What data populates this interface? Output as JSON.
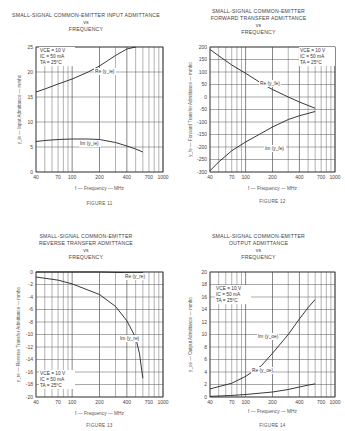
{
  "page": {
    "figures": [
      {
        "id": "fig11",
        "title": "SMALL-SIGNAL COMMON-EMITTER INPUT ADMITTANCE\nvs\nFREQUENCY",
        "xlabel": "f — Frequency — MHz",
        "ylabel": "y_ie — Input Admittance — mmho",
        "caption": "FIGURE 11",
        "conditions": [
          "VCE = 10 V",
          "IC = 50 mA",
          "TA = 25°C"
        ],
        "curve_labels": [
          "Re (y_ie)",
          "Im (y_ie)"
        ]
      },
      {
        "id": "fig12",
        "title": "SMALL-SIGNAL COMMON-EMITTER\nFORWARD TRANSFER ADMITTANCE\nvs\nFREQUENCY",
        "xlabel": "f — Frequency — MHz",
        "ylabel": "y_fe — Forward Transfer Admittance — mmho",
        "caption": "FIGURE 12",
        "conditions": [
          "VCE = 10 V",
          "IC = 50 mA",
          "TA = 25°C"
        ],
        "curve_labels": [
          "Re (y_fe)",
          "Im (y_fe)"
        ]
      },
      {
        "id": "fig13",
        "title": "SMALL-SIGNAL COMMON-EMITTER\nREVERSE TRANSFER ADMITTANCE\nvs\nFREQUENCY",
        "xlabel": "f — Frequency — MHz",
        "ylabel": "y_re — Reverse Transfer Admittance — mmho",
        "caption": "FIGURE 13",
        "conditions": [
          "VCE = 10 V",
          "IC = 50 mA",
          "TA = 25°C"
        ],
        "curve_labels": [
          "Re (y_re)",
          "Im (y_re)"
        ]
      },
      {
        "id": "fig14",
        "title": "SMALL-SIGNAL COMMON-EMITTER\nOUTPUT ADMITTANCE\nvs\nFREQUENCY",
        "xlabel": "f — Frequency — MHz",
        "ylabel": "y_oe — Output Admittance — mmho",
        "caption": "FIGURE 14",
        "conditions": [
          "VCE = 10 V",
          "IC = 50 mA",
          "TA = 25°C"
        ],
        "curve_labels": [
          "Im (y_oe)",
          "Re (y_oe)"
        ]
      }
    ]
  },
  "chart_data": [
    {
      "type": "line",
      "title": "SMALL-SIGNAL COMMON-EMITTER INPUT ADMITTANCE vs FREQUENCY",
      "xlabel": "f — Frequency — MHz",
      "ylabel": "y_ie — Input Admittance — mmho",
      "xscale": "log",
      "xlim": [
        40,
        1000
      ],
      "ylim": [
        0,
        25
      ],
      "xticks": [
        40,
        70,
        100,
        200,
        400,
        700,
        1000
      ],
      "xtick_labels": [
        "40",
        "70",
        "100",
        "200",
        "400",
        "700",
        "1000"
      ],
      "yticks": [
        0,
        5,
        10,
        15,
        20,
        25
      ],
      "grid": true,
      "x": [
        40,
        50,
        70,
        100,
        150,
        200,
        300,
        400,
        500,
        600
      ],
      "series": [
        {
          "name": "Re (y_ie)",
          "x": [
            40,
            50,
            70,
            100,
            150,
            200,
            300,
            400,
            500
          ],
          "values": [
            16.0,
            16.6,
            17.6,
            18.6,
            20.0,
            21.2,
            23.3,
            24.6,
            25.0
          ]
        },
        {
          "name": "Im (y_ie)",
          "x": [
            40,
            50,
            70,
            100,
            150,
            200,
            300,
            400,
            500,
            600
          ],
          "values": [
            6.1,
            6.3,
            6.5,
            6.6,
            6.6,
            6.5,
            5.9,
            5.2,
            4.6,
            4.0
          ]
        }
      ],
      "annotations": [
        "VCE = 10 V",
        "IC = 50 mA",
        "TA = 25°C"
      ],
      "caption": "FIGURE 11"
    },
    {
      "type": "line",
      "title": "SMALL-SIGNAL COMMON-EMITTER FORWARD TRANSFER ADMITTANCE vs FREQUENCY",
      "xlabel": "f — Frequency — MHz",
      "ylabel": "y_fe — Forward Transfer Admittance — mmho",
      "xscale": "log",
      "xlim": [
        40,
        1000
      ],
      "ylim": [
        -300,
        200
      ],
      "xticks": [
        40,
        70,
        100,
        200,
        400,
        700,
        1000
      ],
      "xtick_labels": [
        "40",
        "70",
        "100",
        "200",
        "400",
        "700",
        "1000"
      ],
      "yticks": [
        -300,
        -250,
        -200,
        -150,
        -100,
        -50,
        0,
        50,
        100,
        150,
        200
      ],
      "grid": true,
      "series": [
        {
          "name": "Re (y_fe)",
          "x": [
            40,
            50,
            70,
            100,
            150,
            200,
            300,
            400,
            600
          ],
          "values": [
            190,
            165,
            128,
            95,
            55,
            30,
            0,
            -20,
            -45
          ]
        },
        {
          "name": "Im (y_fe)",
          "x": [
            40,
            50,
            70,
            100,
            150,
            200,
            300,
            400,
            600
          ],
          "values": [
            -295,
            -260,
            -215,
            -180,
            -145,
            -120,
            -90,
            -75,
            -58
          ]
        }
      ],
      "annotations": [
        "VCE = 10 V",
        "IC = 50 mA",
        "TA = 25°C"
      ],
      "caption": "FIGURE 12"
    },
    {
      "type": "line",
      "title": "SMALL-SIGNAL COMMON-EMITTER REVERSE TRANSFER ADMITTANCE vs FREQUENCY",
      "xlabel": "f — Frequency — MHz",
      "ylabel": "y_re — Reverse Transfer Admittance — mmho",
      "xscale": "log",
      "xlim": [
        40,
        1000
      ],
      "ylim": [
        -20,
        0
      ],
      "xticks": [
        40,
        70,
        100,
        200,
        400,
        700,
        1000
      ],
      "xtick_labels": [
        "40",
        "70",
        "100",
        "200",
        "400",
        "700",
        "1000"
      ],
      "yticks": [
        -20,
        -18,
        -16,
        -14,
        -12,
        -10,
        -8,
        -6,
        -4,
        -2,
        0
      ],
      "grid": true,
      "series": [
        {
          "name": "Re (y_re)",
          "x": [
            40,
            100,
            200,
            400,
            600
          ],
          "values": [
            0.0,
            0.0,
            0.0,
            -0.1,
            -0.1
          ]
        },
        {
          "name": "Im (y_re)",
          "x": [
            40,
            70,
            100,
            200,
            300,
            400,
            500,
            550,
            600
          ],
          "values": [
            -0.8,
            -1.3,
            -1.9,
            -3.6,
            -5.5,
            -7.8,
            -10.5,
            -13.0,
            -17.0
          ]
        }
      ],
      "annotations": [
        "VCE = 10 V",
        "IC = 50 mA",
        "TA = 25°C"
      ],
      "caption": "FIGURE 13"
    },
    {
      "type": "line",
      "title": "SMALL-SIGNAL COMMON-EMITTER OUTPUT ADMITTANCE vs FREQUENCY",
      "xlabel": "f — Frequency — MHz",
      "ylabel": "y_oe — Output Admittance — mmho",
      "xscale": "log",
      "xlim": [
        40,
        1000
      ],
      "ylim": [
        0,
        20
      ],
      "xticks": [
        40,
        70,
        100,
        200,
        400,
        700,
        1000
      ],
      "xtick_labels": [
        "40",
        "70",
        "100",
        "200",
        "400",
        "700",
        "1000"
      ],
      "yticks": [
        0,
        2,
        4,
        6,
        8,
        10,
        12,
        14,
        16,
        18,
        20
      ],
      "grid": true,
      "series": [
        {
          "name": "Im (y_oe)",
          "x": [
            40,
            70,
            100,
            150,
            200,
            300,
            400,
            500,
            600
          ],
          "values": [
            1.3,
            2.2,
            3.3,
            5.0,
            7.0,
            10.0,
            12.5,
            14.3,
            15.6
          ]
        },
        {
          "name": "Re (y_oe)",
          "x": [
            40,
            70,
            100,
            200,
            300,
            400,
            500,
            600
          ],
          "values": [
            0.1,
            0.25,
            0.4,
            0.8,
            1.2,
            1.6,
            1.9,
            2.1
          ]
        }
      ],
      "annotations": [
        "VCE = 10 V",
        "IC = 50 mA",
        "TA = 25°C"
      ],
      "caption": "FIGURE 14"
    }
  ]
}
